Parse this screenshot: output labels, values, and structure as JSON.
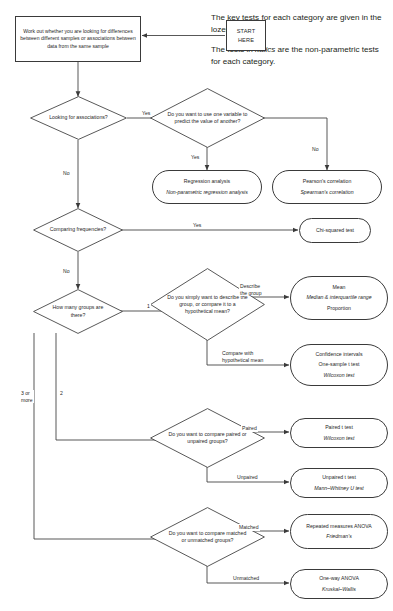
{
  "diagram": {
    "note": {
      "line1": "The key tests for each category are given in the lozenges.",
      "line2_a": "The tests in ",
      "line2_italic": "italics",
      "line2_b": " are the non-parametric tests for each category."
    },
    "nodes": {
      "start": "START\nHERE",
      "intro_box": "Work out whether you are looking for differences between different samples or associations between data from the same sample",
      "d_associations": "Looking for associations?",
      "d_predict": "Do you want to use one variable to predict the value of another?",
      "d_frequencies": "Comparing frequencies?",
      "d_groups": "How many groups are there?",
      "d_describe": "Do you simply want to describe the group, or compare it to a hypothetical mean?",
      "d_paired": "Do you want to compare paired or unpaired groups?",
      "d_matched": "Do you want to compare matched or unmatched groups?"
    },
    "lozenges": {
      "regression": [
        "Regression analysis",
        "Non-parametric regression analysis"
      ],
      "correlation": [
        "Pearson's correlation",
        "Spearman's correlation"
      ],
      "chisquared": [
        "Chi-squared test"
      ],
      "describe": [
        "Mean",
        "Median & interquartile range",
        "Proportion"
      ],
      "hypothetical": [
        "Confidence intervals",
        "One-sample t test",
        "Wilcoxon test"
      ],
      "paired": [
        "Paired t test",
        "Wilcoxon test"
      ],
      "unpaired": [
        "Unpaired t test",
        "Mann–Whitney U test"
      ],
      "matched": [
        "Repeated measures ANOVA",
        "Friedman's"
      ],
      "unmatched": [
        "One-way ANOVA",
        "Kruskal–Wallis"
      ]
    },
    "edge_labels": {
      "assoc_yes": "Yes",
      "assoc_no": "No",
      "predict_yes": "Yes",
      "predict_no": "No",
      "freq_yes": "Yes",
      "freq_no": "No",
      "groups_one": "1",
      "groups_two": "2",
      "groups_three_or_more": "3 or\nmore",
      "describe_group": "Describe\nthe group",
      "compare_hypothetical": "Compare with\nhypothetical mean",
      "paired": "Paired",
      "unpaired": "Unpaired",
      "matched": "Matched",
      "unmatched": "Unmatched"
    },
    "colors": {
      "stroke": "#3a3a3a",
      "text": "#1f1f1f",
      "background": "#ffffff"
    }
  }
}
